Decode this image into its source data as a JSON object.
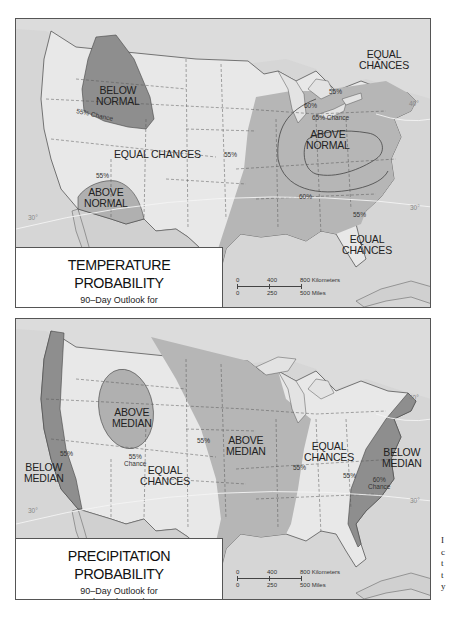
{
  "temperature_map": {
    "title": "TEMPERATURE PROBABILITY",
    "subtitle_line1": "90–Day Outlook for",
    "subtitle_line2": "August through October 1988",
    "regions": {
      "below_normal_nw": {
        "line1": "BELOW",
        "line2": "NORMAL",
        "chance": "55% Chance"
      },
      "equal_center": "EQUAL CHANCES",
      "above_normal_sw": {
        "line1": "ABOVE",
        "line2": "NORMAL",
        "pct": "55%"
      },
      "above_normal_east": {
        "line1": "ABOVE",
        "line2": "NORMAL",
        "chance": "65% Chance"
      },
      "equal_ne": {
        "line1": "EQUAL",
        "line2": "CHANCES"
      },
      "equal_se": {
        "line1": "EQUAL",
        "line2": "CHANCES"
      }
    },
    "contour_labels": {
      "c55_ne": "55%",
      "c60_n": "60%",
      "c55_w": "55%",
      "c60_s": "60%",
      "c55_se": "55%"
    },
    "latitude_labels": {
      "lat40": "40°",
      "lat30_w": "30°",
      "lat30_e": "30°"
    },
    "scale": {
      "km0": "0",
      "km400": "400",
      "km800": "800 Kilometers",
      "mi0": "0",
      "mi250": "250",
      "mi500": "500 Miles"
    }
  },
  "precipitation_map": {
    "title": "PRECIPITATION PROBABILITY",
    "subtitle_line1": "90–Day Outlook for",
    "subtitle_line2": "August through October 1988",
    "regions": {
      "above_median_west": {
        "line1": "ABOVE",
        "line2": "MEDIAN",
        "chance_pct": "55%",
        "chance_word": "Chance"
      },
      "below_median_west": {
        "line1": "BELOW",
        "line2": "MEDIAN",
        "pct": "55%"
      },
      "equal_west": {
        "line1": "EQUAL",
        "line2": "CHANCES"
      },
      "above_median_central": {
        "line1": "ABOVE",
        "line2": "MEDIAN",
        "pct": "55%"
      },
      "equal_east": {
        "line1": "EQUAL",
        "line2": "CHANCES",
        "pct": "55%"
      },
      "below_median_east": {
        "line1": "BELOW",
        "line2": "MEDIAN",
        "pct": "55%",
        "chance_pct": "60%",
        "chance_word": "Chance"
      }
    },
    "latitude_labels": {
      "lat40": "40°",
      "lat30_w": "30°",
      "lat30_e": "30°"
    },
    "scale": {
      "km0": "0",
      "km400": "400",
      "km800": "800 Kilometers",
      "mi0": "0",
      "mi250": "250",
      "mi500": "500 Miles"
    }
  },
  "side_text": [
    "I",
    "c",
    "t",
    "t",
    "y"
  ],
  "colors": {
    "water": "#d6d6d6",
    "land": "#e8e8e8",
    "medium_shade": "#b4b4b4",
    "dark_shade": "#8e8e8e",
    "mexico": "#c8c8c8"
  }
}
